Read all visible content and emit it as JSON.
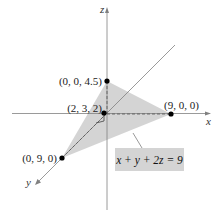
{
  "diagram": {
    "type": "3d-plane-intercepts",
    "axes": {
      "x_label": "x",
      "y_label": "y",
      "z_label": "z"
    },
    "points": [
      {
        "name": "z-intercept",
        "label": "(0, 0, 4.5)"
      },
      {
        "name": "given-point",
        "label": "(2, 3, 2)"
      },
      {
        "name": "x-intercept",
        "label": "(9, 0, 0)"
      },
      {
        "name": "y-intercept",
        "label": "(0, 9, 0)"
      }
    ],
    "plane_equation": "x + y + 2z = 9",
    "colors": {
      "plane_fill": "#cfcfcf",
      "axis": "#777777",
      "point": "#000000",
      "label_box": "#d4d4d4"
    }
  }
}
